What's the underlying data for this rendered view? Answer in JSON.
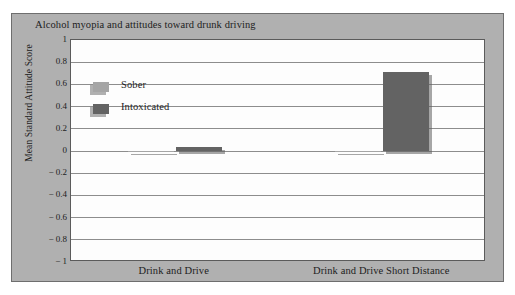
{
  "chart_data": {
    "type": "bar",
    "title": "Alcohol myopia and attitudes toward drunk driving",
    "xlabel": "",
    "ylabel": "Mean Standard Attitude Score",
    "categories": [
      "Drink and Drive",
      "Drink and Drive Short Distance"
    ],
    "series": [
      {
        "name": "Sober",
        "values": [
          -0.01,
          -0.01
        ],
        "color": "#a5a5a5"
      },
      {
        "name": "Intoxicated",
        "values": [
          0.04,
          0.71
        ],
        "color": "#636363"
      }
    ],
    "ylim": [
      -1,
      1
    ],
    "ytick_labels": [
      "1",
      "0.8",
      "0.6",
      "0.4",
      "0.2",
      "0",
      "− 0.2",
      "− 0.4",
      "− 0.6",
      "− 0.8",
      "− 1"
    ],
    "ytick_values": [
      1,
      0.8,
      0.6,
      0.4,
      0.2,
      0,
      -0.2,
      -0.4,
      -0.6,
      -0.8,
      -1
    ],
    "grid": true,
    "legend_position": "inside-top-left",
    "legend_entries": [
      "Sober",
      "Intoxicated"
    ],
    "background_color": "#b0b0b0",
    "plot_background_color": "#fdfdfd",
    "gridline_color": "#8d8d8d",
    "border_color": "#5b5b5b"
  }
}
